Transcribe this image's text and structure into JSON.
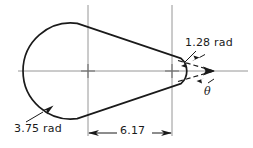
{
  "drawing": {
    "type": "engineering-dimensioned-outline",
    "title": "Teardrop / ovoid profile with radii and included angle",
    "stroke_color": "#1a1a1a",
    "centerline_color": "#8a8a8a",
    "background": "#ffffff",
    "labels": {
      "radius_small": "1.28 rad",
      "radius_large": "3.75 rad",
      "dimension_length": "6.17",
      "angle_symbol": "θ"
    },
    "annotations": [
      {
        "name": "small-radius-callout",
        "text": "1.28 rad",
        "points_to": "right apex arc"
      },
      {
        "name": "large-radius-callout",
        "text": "3.75 rad",
        "points_to": "lower-left arc"
      },
      {
        "name": "center-distance-dimension",
        "text": "6.17",
        "between": "left arc center and right arc center"
      },
      {
        "name": "included-angle",
        "text": "θ",
        "between": "two tangent lines at right apex"
      }
    ],
    "values": {
      "small_radius": 1.28,
      "large_radius": 3.75,
      "center_distance": 6.17
    },
    "centers": [
      {
        "name": "left-arc-center",
        "x": 88,
        "y": 71
      },
      {
        "name": "right-arc-center",
        "x": 172,
        "y": 71
      }
    ]
  }
}
